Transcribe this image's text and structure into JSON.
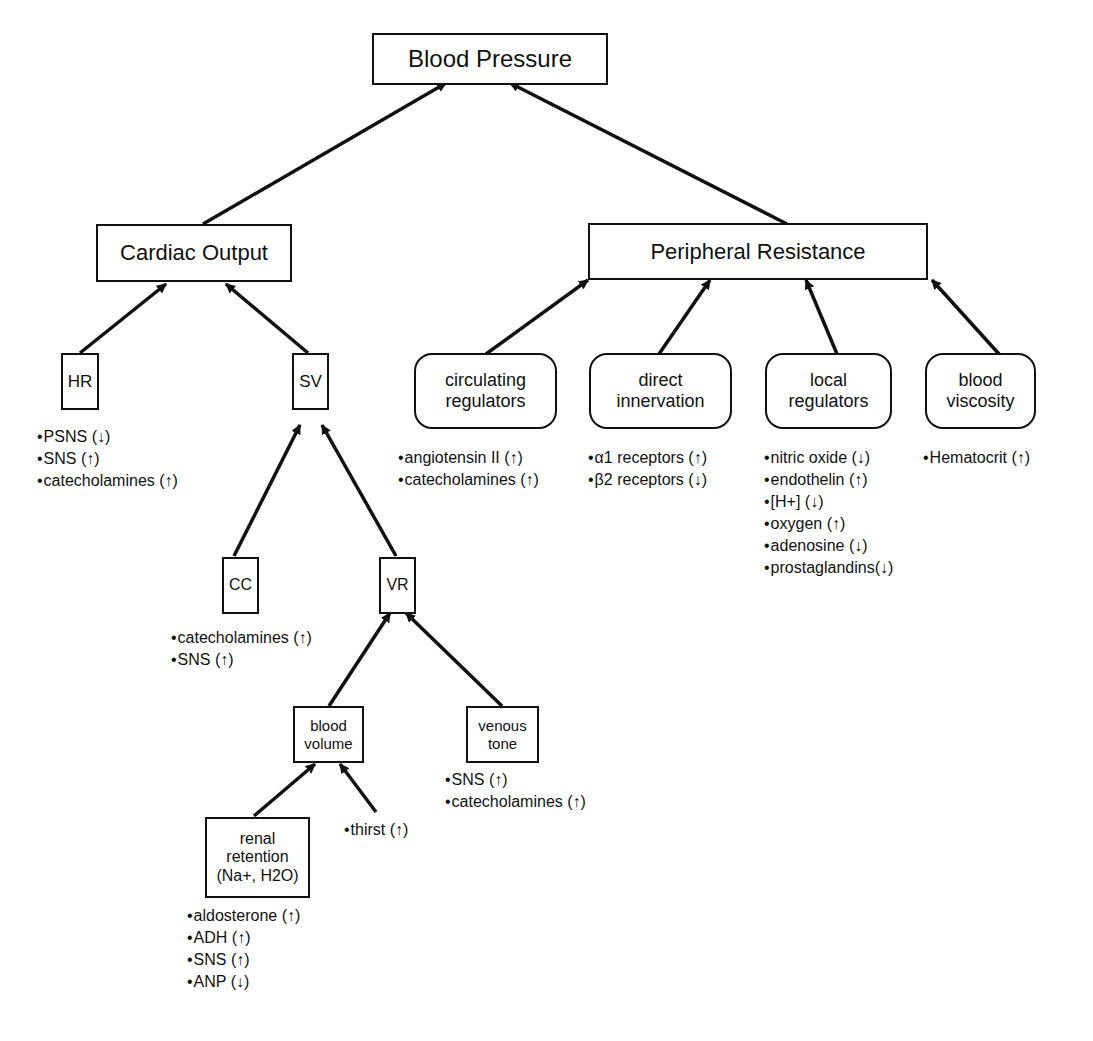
{
  "title": "Blood Pressure",
  "nodes": {
    "bp": {
      "label": "Blood Pressure"
    },
    "co": {
      "label": "Cardiac Output"
    },
    "pr": {
      "label": "Peripheral Resistance"
    },
    "hr": {
      "label": "HR"
    },
    "sv": {
      "label": "SV"
    },
    "cc": {
      "label": "CC"
    },
    "vr": {
      "label": "VR"
    },
    "bv": {
      "label": "blood\nvolume"
    },
    "vt": {
      "label": "venous\ntone"
    },
    "rr": {
      "label": "renal\nretention\n(Na+, H2O)"
    },
    "circ": {
      "label": "circulating\nregulators"
    },
    "dir": {
      "label": "direct\ninnervation"
    },
    "loc": {
      "label": "local\nregulators"
    },
    "visc": {
      "label": "blood\nviscosity"
    }
  },
  "bullets": {
    "hr": [
      "PSNS (↓)",
      "SNS (↑)",
      "catecholamines (↑)"
    ],
    "cc": [
      "catecholamines (↑)",
      "SNS (↑)"
    ],
    "vt": [
      "SNS (↑)",
      "catecholamines (↑)"
    ],
    "thirst": [
      "thirst (↑)"
    ],
    "rr": [
      "aldosterone (↑)",
      "ADH (↑)",
      "SNS (↑)",
      "ANP (↓)"
    ],
    "circ": [
      "angiotensin II (↑)",
      "catecholamines (↑)"
    ],
    "dir": [
      "α1 receptors (↑)",
      "β2 receptors (↓)"
    ],
    "loc": [
      "nitric oxide (↓)",
      "endothelin (↑)",
      "[H+] (↓)",
      "oxygen (↑)",
      "adenosine (↓)",
      "prostaglandins(↓)"
    ],
    "visc": [
      "Hematocrit (↑)"
    ]
  }
}
